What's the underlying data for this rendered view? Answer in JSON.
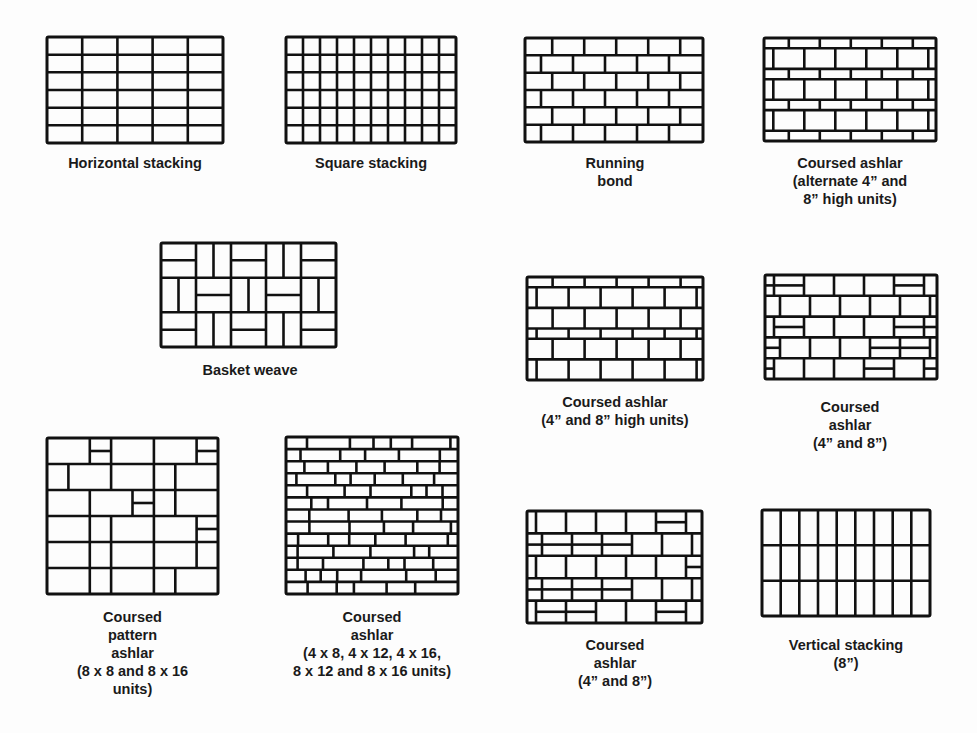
{
  "figure": {
    "panels": [
      {
        "id": "horizontal-stacking",
        "caption": "Horizontal stacking",
        "box": [
          47,
          37,
          176,
          106
        ],
        "caption_pos": [
          20,
          154,
          230
        ],
        "pattern": {
          "type": "grid",
          "cols": 5,
          "rows": 6
        }
      },
      {
        "id": "square-stacking",
        "caption": "Square stacking",
        "box": [
          286,
          37,
          170,
          106
        ],
        "caption_pos": [
          256,
          154,
          230
        ],
        "pattern": {
          "type": "grid",
          "cols": 10,
          "rows": 6
        }
      },
      {
        "id": "running-bond",
        "caption": "Running\nbond",
        "box": [
          525,
          38,
          178,
          104
        ],
        "caption_pos": [
          515,
          154,
          200
        ],
        "pattern": {
          "type": "running",
          "rows": 6,
          "brick": 32
        }
      },
      {
        "id": "coursed-ashlar-alternate",
        "caption": "Coursed ashlar\n(alternate 4” and\n8” high units)",
        "box": [
          764,
          38,
          172,
          103
        ],
        "caption_pos": [
          750,
          154,
          200
        ],
        "pattern": {
          "type": "alternate",
          "courses": [
            0.5,
            1,
            0.5,
            1,
            0.5,
            1,
            0.5
          ],
          "brick": 31
        }
      },
      {
        "id": "basket-weave",
        "caption": "Basket weave",
        "box": [
          161,
          243,
          175,
          104
        ],
        "caption_pos": [
          150,
          361,
          200
        ],
        "pattern": {
          "type": "basket",
          "cols": 5,
          "rows": 3
        }
      },
      {
        "id": "coursed-ashlar-4-8-high",
        "caption": "Coursed ashlar\n(4” and 8” high units)",
        "box": [
          527,
          277,
          176,
          103
        ],
        "caption_pos": [
          505,
          393,
          220
        ],
        "pattern": {
          "type": "alternate",
          "courses": [
            0.5,
            1,
            1,
            0.5,
            1,
            1
          ],
          "brick": 32
        }
      },
      {
        "id": "coursed-ashlar-4-8-a",
        "caption": "Coursed\nashlar\n(4” and 8”)",
        "box": [
          765,
          275,
          172,
          104
        ],
        "caption_pos": [
          750,
          398,
          200
        ],
        "pattern": {
          "type": "mixed",
          "rows": 5,
          "seed": 3
        }
      },
      {
        "id": "coursed-pattern-ashlar",
        "caption": "Coursed\npattern\nashlar\n(8 x 8 and 8 x 16\nunits)",
        "box": [
          47,
          438,
          171,
          156
        ],
        "caption_pos": [
          20,
          608,
          225
        ],
        "pattern": {
          "type": "pattern",
          "seed": 7
        }
      },
      {
        "id": "coursed-ashlar-multi",
        "caption": "Coursed\nashlar\n(4 x 8, 4 x 12, 4 x 16,\n8 x 12 and 8 x 16 units)",
        "box": [
          286,
          437,
          172,
          157
        ],
        "caption_pos": [
          262,
          608,
          220
        ],
        "pattern": {
          "type": "random",
          "rows": 13,
          "seed": 11
        }
      },
      {
        "id": "coursed-ashlar-4-8-b",
        "caption": "Coursed\nashlar\n(4” and 8”)",
        "box": [
          527,
          511,
          175,
          112
        ],
        "caption_pos": [
          515,
          636,
          200
        ],
        "pattern": {
          "type": "mixed",
          "rows": 5,
          "seed": 19
        }
      },
      {
        "id": "vertical-stacking",
        "caption": "Vertical stacking\n(8”)",
        "box": [
          762,
          510,
          168,
          106
        ],
        "caption_pos": [
          746,
          636,
          200
        ],
        "pattern": {
          "type": "grid",
          "cols": 9,
          "rows": 3
        }
      }
    ],
    "colors": {
      "line": "#111111",
      "background": "#fdfdfd"
    }
  }
}
